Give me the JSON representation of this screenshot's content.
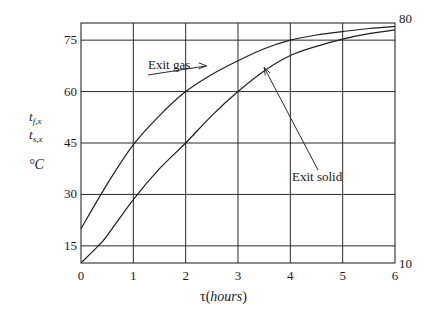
{
  "chart_data": {
    "type": "line",
    "title": "",
    "xlabel": "τ(hours)",
    "ylabel": [
      "t_f,x",
      "t_s,x",
      "°C"
    ],
    "xlim": [
      0,
      6
    ],
    "ylim": [
      10,
      80
    ],
    "x_ticks": [
      0,
      1,
      2,
      3,
      4,
      5,
      6
    ],
    "y_ticks_left": [
      15,
      30,
      45,
      60,
      75
    ],
    "y_ticks_right": [
      10,
      80
    ],
    "grid": true,
    "legend": "none (inline annotations)",
    "series": [
      {
        "name": "Exit gas",
        "x": [
          0,
          0.5,
          1,
          1.5,
          2,
          2.5,
          3,
          3.5,
          4,
          4.5,
          5,
          5.5,
          6
        ],
        "y": [
          20,
          33,
          44.5,
          53,
          60,
          65,
          69,
          72.5,
          75,
          76.5,
          77.5,
          78.4,
          79
        ]
      },
      {
        "name": "Exit solid",
        "x": [
          0,
          0.33,
          0.5,
          1,
          1.5,
          2,
          2.5,
          3,
          3.5,
          4,
          4.5,
          5,
          5.5,
          6
        ],
        "y": [
          10,
          15,
          18,
          28.5,
          37.5,
          45,
          53,
          60,
          66,
          70.5,
          73.2,
          75.3,
          76.9,
          78
        ]
      }
    ],
    "annotations": [
      {
        "text": "Exit gas",
        "arrow_to": [
          2.4,
          67.5
        ]
      },
      {
        "text": "Exit solid",
        "arrow_to": [
          3.5,
          67
        ]
      }
    ]
  },
  "axis": {
    "ylabel_tf": "t",
    "ylabel_tf_sub": "f,x",
    "ylabel_ts": "t",
    "ylabel_ts_sub": "s,x",
    "ylabel_unit": "°C",
    "xlabel_tau": "τ(",
    "xlabel_unit": "hours",
    "xlabel_close": ")"
  }
}
